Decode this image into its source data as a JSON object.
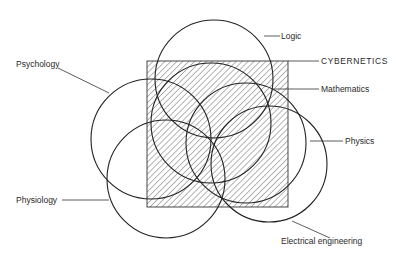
{
  "diagram": {
    "central_concept": {
      "label": "CYBERNETICS",
      "shape": "hatched-square"
    },
    "disciplines": [
      {
        "id": "logic",
        "label": "Logic"
      },
      {
        "id": "mathematics",
        "label": "Mathematics"
      },
      {
        "id": "psychology",
        "label": "Psychology"
      },
      {
        "id": "physiology",
        "label": "Physiology"
      },
      {
        "id": "physics",
        "label": "Physics"
      },
      {
        "id": "electrical_engineering",
        "label": "Electrical engineering"
      }
    ]
  },
  "labels": {
    "logic": "Logic",
    "cybernetics": "CYBERNETICS",
    "mathematics": "Mathematics",
    "psychology": "Psychology",
    "physiology": "Physiology",
    "physics": "Physics",
    "electrical_engineering": "Electrical engineering"
  },
  "colors": {
    "stroke": "#222222",
    "hatch": "#555555",
    "background": "#ffffff"
  }
}
